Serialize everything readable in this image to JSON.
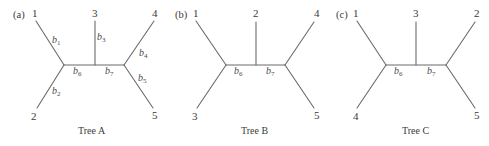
{
  "colors": {
    "edge": "#6b6b6b",
    "text": "#3a3a3a",
    "background": "#ffffff"
  },
  "trees": [
    {
      "panel": "(a)",
      "caption": "Tree A",
      "leaves": {
        "top_left": "1",
        "bottom_left": "2",
        "top_center": "3",
        "top_right": "4",
        "bottom_right": "5"
      },
      "branches": {
        "top_left": {
          "base": "b",
          "sub": "1"
        },
        "bottom_left": {
          "base": "b",
          "sub": "2"
        },
        "top_center": {
          "base": "b",
          "sub": "3"
        },
        "top_right": {
          "base": "b",
          "sub": "4"
        },
        "bottom_right": {
          "base": "b",
          "sub": "5"
        },
        "internal_left": {
          "base": "b",
          "sub": "6"
        },
        "internal_right": {
          "base": "b",
          "sub": "7"
        }
      }
    },
    {
      "panel": "(b)",
      "caption": "Tree B",
      "leaves": {
        "top_left": "1",
        "bottom_left": "3",
        "top_center": "2",
        "top_right": "4",
        "bottom_right": "5"
      },
      "branches": {
        "internal_left": {
          "base": "b",
          "sub": "6"
        },
        "internal_right": {
          "base": "b",
          "sub": "7"
        }
      }
    },
    {
      "panel": "(c)",
      "caption": "Tree C",
      "leaves": {
        "top_left": "1",
        "bottom_left": "4",
        "top_center": "3",
        "top_right": "2",
        "bottom_right": "5"
      },
      "branches": {
        "internal_left": {
          "base": "b",
          "sub": "6"
        },
        "internal_right": {
          "base": "b",
          "sub": "7"
        }
      }
    }
  ]
}
